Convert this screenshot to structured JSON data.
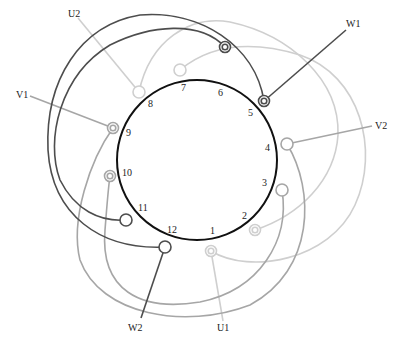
{
  "diagram": {
    "colors": {
      "U": "#cfcfcf",
      "V": "#a6a6a6",
      "W": "#4d4d4d",
      "stator": "#111111"
    },
    "stator": {
      "cx": 197,
      "cy": 160,
      "r": 80
    },
    "slots": [
      {
        "n": "1",
        "lx": 210,
        "ly": 234
      },
      {
        "n": "2",
        "lx": 244,
        "ly": 218
      },
      {
        "n": "3",
        "lx": 264,
        "ly": 186
      },
      {
        "n": "4",
        "lx": 267,
        "ly": 151
      },
      {
        "n": "5",
        "lx": 250,
        "ly": 116
      },
      {
        "n": "6",
        "lx": 220,
        "ly": 96
      },
      {
        "n": "7",
        "lx": 182,
        "ly": 91
      },
      {
        "n": "8",
        "lx": 150,
        "ly": 107
      },
      {
        "n": "9",
        "lx": 126,
        "ly": 136
      },
      {
        "n": "10",
        "lx": 122,
        "ly": 176
      },
      {
        "n": "11",
        "lx": 138,
        "ly": 211
      },
      {
        "n": "12",
        "lx": 170,
        "ly": 233
      }
    ],
    "terminals": [
      {
        "name": "U1",
        "label_x": 217,
        "label_y": 331
      },
      {
        "name": "U2",
        "label_x": 68,
        "label_y": 17
      },
      {
        "name": "V1",
        "label_x": 16,
        "label_y": 98
      },
      {
        "name": "V2",
        "label_x": 380,
        "label_y": 129
      },
      {
        "name": "W1",
        "label_x": 346,
        "label_y": 27
      },
      {
        "name": "W2",
        "label_x": 130,
        "label_y": 331
      }
    ]
  }
}
